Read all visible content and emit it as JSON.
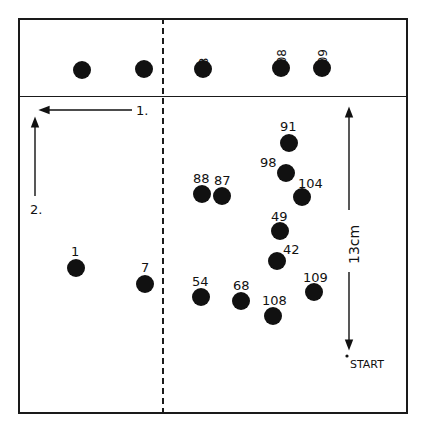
{
  "top_strip": {
    "spots": [
      {
        "label": "1",
        "x": 82,
        "y": 70
      },
      {
        "label": "7",
        "x": 144,
        "y": 69
      },
      {
        "label": "88",
        "x": 203,
        "y": 69
      },
      {
        "label": "108",
        "x": 281,
        "y": 68
      },
      {
        "label": "109",
        "x": 322,
        "y": 68
      }
    ]
  },
  "main_plate": {
    "spots": [
      {
        "label": "91",
        "x": 289,
        "y": 143
      },
      {
        "label": "98",
        "x": 286,
        "y": 173
      },
      {
        "label": "104",
        "x": 302,
        "y": 197
      },
      {
        "label": "88",
        "x": 202,
        "y": 194
      },
      {
        "label": "87",
        "x": 222,
        "y": 196
      },
      {
        "label": "49",
        "x": 280,
        "y": 231
      },
      {
        "label": "42",
        "x": 277,
        "y": 261
      },
      {
        "label": "1",
        "x": 76,
        "y": 268
      },
      {
        "label": "7",
        "x": 145,
        "y": 284
      },
      {
        "label": "54",
        "x": 201,
        "y": 297
      },
      {
        "label": "68",
        "x": 241,
        "y": 301
      },
      {
        "label": "108",
        "x": 273,
        "y": 316
      },
      {
        "label": "109",
        "x": 314,
        "y": 292
      }
    ]
  },
  "direction_labels": {
    "first": "1.",
    "second": "2."
  },
  "scale": {
    "label": "13cm"
  },
  "origin": {
    "label": "START"
  }
}
